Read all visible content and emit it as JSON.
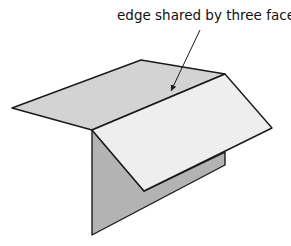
{
  "diagram": {
    "label": "edge shared by three faces",
    "colors": {
      "top_flap": "#d3d3d3",
      "right_flap": "#eeeeee",
      "side_face": "#b3b3b3",
      "stroke": "#1a1a1a",
      "text": "#111111"
    },
    "shapes": {
      "top_flap": "12,108 141,60 225,74 92,130",
      "side_face": "92,130 144,191 225,152 225,165 92,235",
      "right_flap": "92,130 225,74 272,128 144,191"
    },
    "arrow": {
      "x1": 200,
      "y1": 30,
      "x2": 171,
      "y2": 91
    }
  }
}
